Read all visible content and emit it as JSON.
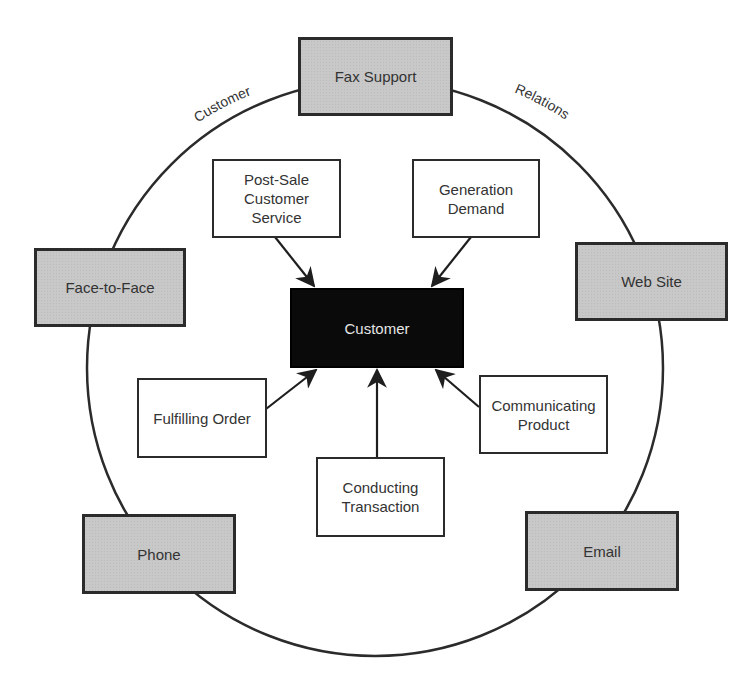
{
  "diagram": {
    "ring_label": {
      "left": "Customer",
      "right": "Relations"
    },
    "center": {
      "label": "Customer"
    },
    "channels": [
      {
        "id": "fax",
        "label": "Fax Support"
      },
      {
        "id": "face",
        "label": "Face-to-Face"
      },
      {
        "id": "web",
        "label": "Web Site"
      },
      {
        "id": "phone",
        "label": "Phone"
      },
      {
        "id": "email",
        "label": "Email"
      }
    ],
    "activities": [
      {
        "id": "postsale",
        "label": "Post-Sale\nCustomer\nService"
      },
      {
        "id": "demand",
        "label": "Generation\nDemand"
      },
      {
        "id": "fulfill",
        "label": "Fulfilling Order"
      },
      {
        "id": "communicate",
        "label": "Communicating\nProduct"
      },
      {
        "id": "transaction",
        "label": "Conducting\nTransaction"
      }
    ],
    "edges": [
      {
        "from": "Post-Sale Customer Service",
        "to": "Customer"
      },
      {
        "from": "Generation Demand",
        "to": "Customer"
      },
      {
        "from": "Fulfilling Order",
        "to": "Customer"
      },
      {
        "from": "Communicating Product",
        "to": "Customer"
      },
      {
        "from": "Conducting Transaction",
        "to": "Customer"
      }
    ],
    "colors": {
      "channel_fill": "#c8c8c8",
      "core_fill": "#0a0a0a",
      "stroke": "#2b2b2b"
    }
  }
}
